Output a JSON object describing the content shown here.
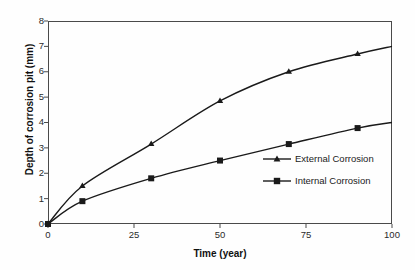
{
  "chart_data": {
    "type": "line",
    "title": "",
    "xlabel": "Time (year)",
    "ylabel": "Depth of corrosion pit (mm)",
    "xlim": [
      0,
      100
    ],
    "ylim": [
      0,
      8
    ],
    "xticks": [
      "0",
      "25",
      "50",
      "75",
      "100"
    ],
    "xtick_values": [
      0,
      25,
      50,
      75,
      100
    ],
    "yticks": [
      "0",
      "1",
      "2",
      "3",
      "4",
      "5",
      "6",
      "7",
      "8"
    ],
    "ytick_values": [
      0,
      1,
      2,
      3,
      4,
      5,
      6,
      7,
      8
    ],
    "grid": false,
    "legend_position": "center-right-inside",
    "series": [
      {
        "name": "External Corrosion",
        "marker": "triangle",
        "color": "#1a1a1a",
        "x": [
          0,
          10,
          30,
          50,
          70,
          90,
          100
        ],
        "values": [
          0,
          1.5,
          3.15,
          4.85,
          6.0,
          6.7,
          7.0
        ]
      },
      {
        "name": "Internal Corrosion",
        "marker": "square",
        "color": "#1a1a1a",
        "x": [
          0,
          10,
          30,
          50,
          70,
          90,
          100
        ],
        "values": [
          0,
          0.9,
          1.8,
          2.5,
          3.15,
          3.78,
          4.0
        ]
      }
    ]
  },
  "legend": {
    "items": [
      {
        "label": "External Corrosion",
        "marker": "triangle-marker"
      },
      {
        "label": "Internal Corrosion",
        "marker": "square-marker"
      }
    ]
  },
  "colors": {
    "line": "#1a1a1a",
    "axis": "#4a4a4a",
    "tick_text": "#2b2b2b",
    "label_text": "#111111",
    "background": "#fefefe"
  }
}
